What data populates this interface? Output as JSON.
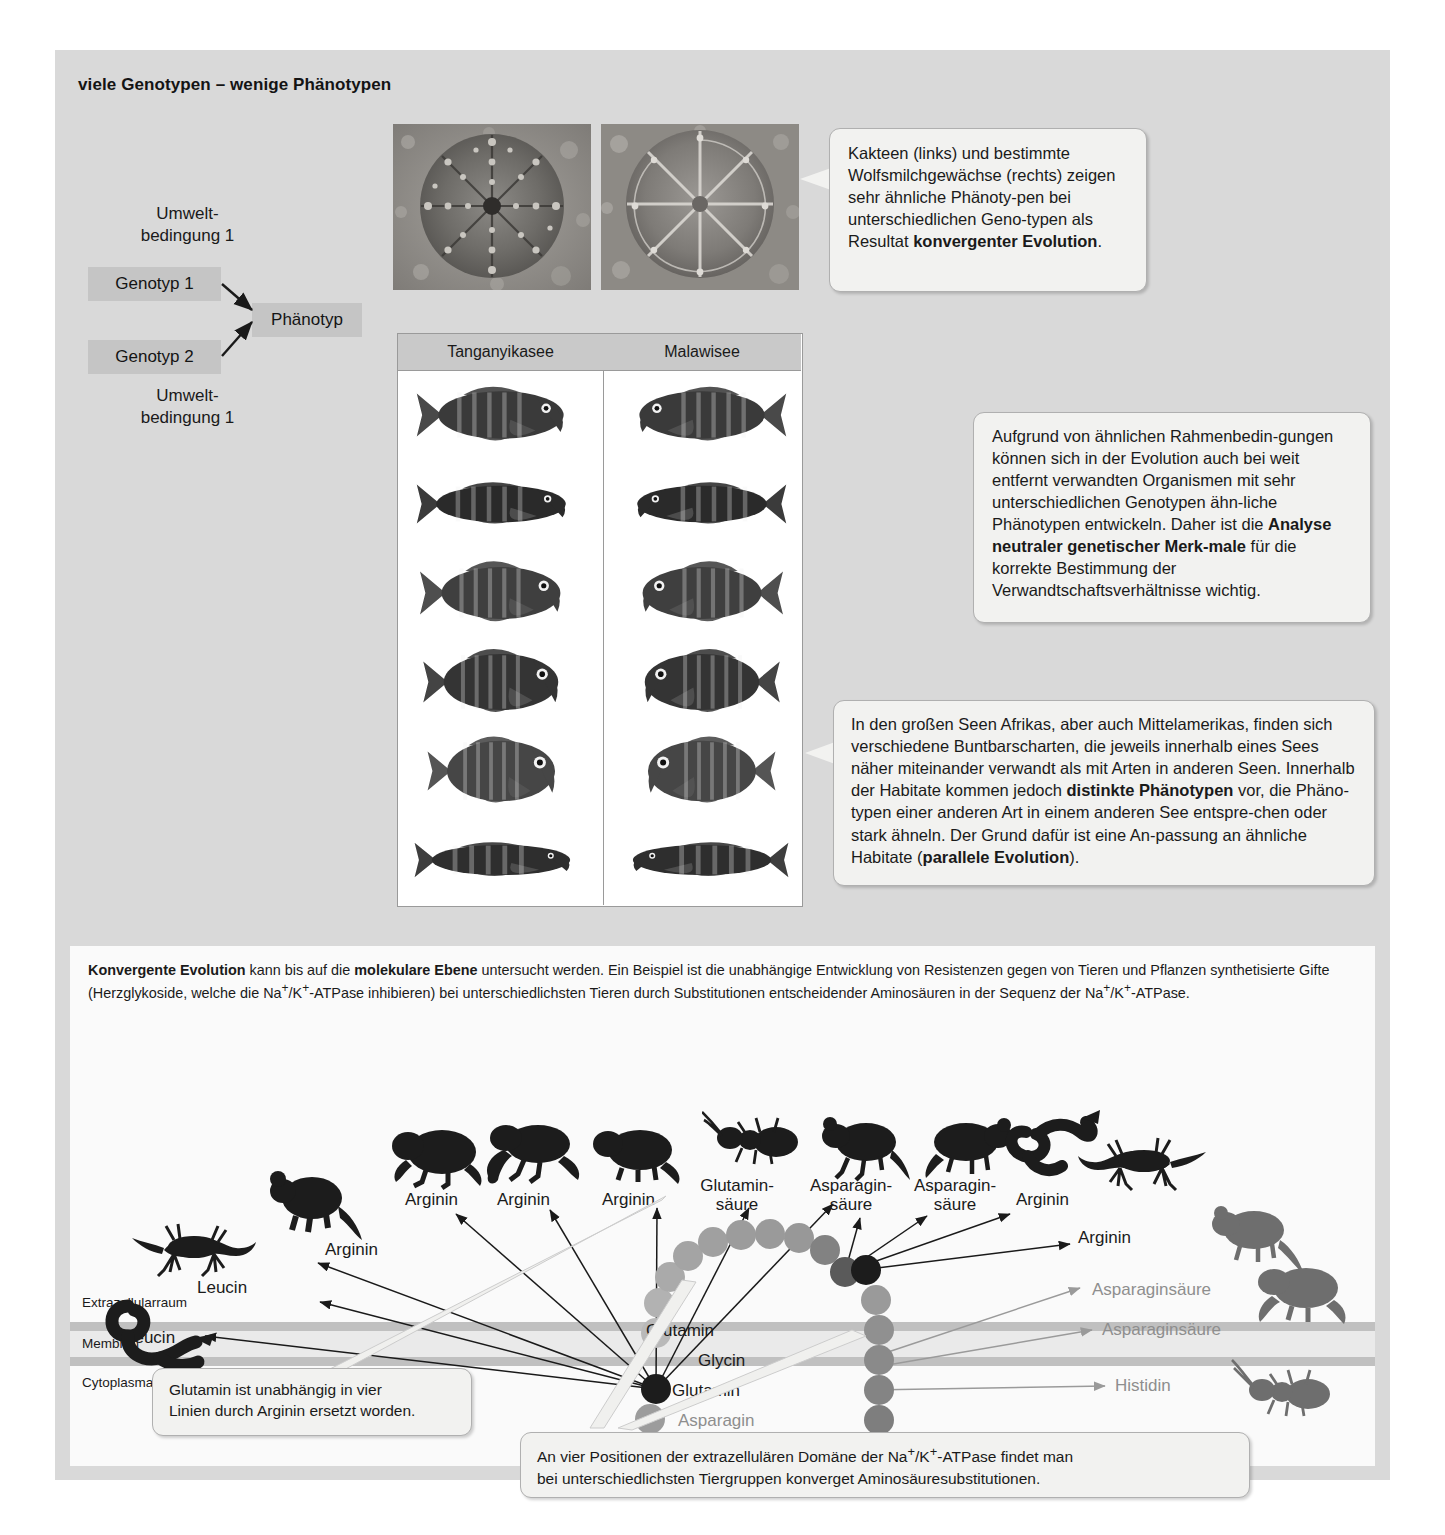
{
  "figure": {
    "title": "viele Genotypen – wenige Phänotypen"
  },
  "genotype_schema": {
    "env_top": "Umwelt-\nbedingung  1",
    "env_bottom": "Umwelt-\nbedingung  1",
    "genotype_1": "Genotyp 1",
    "genotype_2": "Genotyp 2",
    "phenotype": "Phänotyp"
  },
  "callouts": {
    "cacti": {
      "text_parts": [
        {
          "t": "Kakteen (links) und bestimmte Wolfsmilchgewächse (rechts) zeigen sehr ähnliche Phänoty-pen bei unterschiedlichen Geno-typen als Resultat ",
          "b": false
        },
        {
          "t": "konvergenter Evolution",
          "b": true
        },
        {
          "t": ".",
          "b": false
        }
      ]
    },
    "neutral_markers": {
      "text_parts": [
        {
          "t": "Aufgrund von ähnlichen Rahmenbedin-gungen können sich in der Evolution auch bei weit entfernt verwandten Organismen mit sehr unterschiedlichen Genotypen ähn-liche Phänotypen entwickeln. Daher ist die ",
          "b": false
        },
        {
          "t": "Analyse neutraler genetischer Merk-male",
          "b": true
        },
        {
          "t": " für die korrekte Bestimmung der Verwandtschaftsverhältnisse wichtig.",
          "b": false
        }
      ]
    },
    "cichlids": {
      "text_parts": [
        {
          "t": "In den großen Seen Afrikas, aber auch Mittelamerikas, finden sich verschiedene Buntbarscharten, die jeweils innerhalb eines Sees näher miteinander verwandt als mit Arten in anderen Seen. Innerhalb der Habitate kommen jedoch ",
          "b": false
        },
        {
          "t": "distinkte Phänotypen",
          "b": true
        },
        {
          "t": " vor, die Phäno-typen einer anderen Art in einem anderen See entspre-chen oder stark ähneln. Der Grund dafür ist eine An-passung an ähnliche Habitate (",
          "b": false
        },
        {
          "t": "parallele Evolution",
          "b": true
        },
        {
          "t": ").",
          "b": false
        }
      ]
    },
    "glutamin_note": {
      "text": "Glutamin ist unabhängig in vier\nLinien durch Arginin ersetzt worden."
    },
    "positions_note": {
      "text_parts": [
        {
          "t": "An vier Positionen der extrazellulären Domäne der Na",
          "b": false
        },
        {
          "t": "+",
          "b": false,
          "sup": true
        },
        {
          "t": "/K",
          "b": false
        },
        {
          "t": "+",
          "b": false,
          "sup": true
        },
        {
          "t": "-ATPase findet man\nbei unterschiedlichsten Tiergruppen konverget Aminosäuresubstitutionen.",
          "b": false
        }
      ]
    }
  },
  "fish_table": {
    "headers": [
      "Tanganyikasee",
      "Malawisee"
    ],
    "row_count": 6
  },
  "molecular": {
    "intro_parts": [
      {
        "t": "Konvergente Evolution",
        "b": true
      },
      {
        "t": " kann bis auf die ",
        "b": false
      },
      {
        "t": "molekulare Ebene",
        "b": true
      },
      {
        "t": " untersucht werden. Ein Beispiel ist die unabhängige Entwicklung von Resistenzen gegen von Tieren und Pflanzen synthetisierte Gifte (Herzglykoside, welche die Na",
        "b": false
      },
      {
        "t": "+",
        "b": false,
        "sup": true
      },
      {
        "t": "/K",
        "b": false
      },
      {
        "t": "+",
        "b": false,
        "sup": true
      },
      {
        "t": "-ATPase inhibieren) bei unterschiedlichsten Tieren durch Substitutionen entscheidender Aminosäuren in der Sequenz der Na",
        "b": false
      },
      {
        "t": "+",
        "b": false,
        "sup": true
      },
      {
        "t": "/K",
        "b": false
      },
      {
        "t": "+",
        "b": false,
        "sup": true
      },
      {
        "t": "-ATPase.",
        "b": false
      }
    ],
    "layers": {
      "extracellular": "Extrazellularraum",
      "membrane": "Membran",
      "cytoplasm": "Cytoplasma"
    },
    "chain_labels": {
      "glutamin_left": "Glutamin",
      "glutamin_top": "Glutamin",
      "glycin": "Glycin",
      "asparagin": "Asparagin"
    },
    "substitutions": [
      {
        "id": "leucin-snake",
        "label": "Leucin",
        "grey": false
      },
      {
        "id": "leucin-lizard",
        "label": "Leucin",
        "grey": false
      },
      {
        "id": "arginin-rat",
        "label": "Arginin",
        "grey": false
      },
      {
        "id": "arginin-toad1",
        "label": "Arginin",
        "grey": false
      },
      {
        "id": "arginin-frog",
        "label": "Arginin",
        "grey": false
      },
      {
        "id": "arginin-toad2",
        "label": "Arginin",
        "grey": false
      },
      {
        "id": "glutaminsaeure-ant",
        "label": "Glutamin-\nsäure",
        "grey": false
      },
      {
        "id": "asparaginsaeure-rat",
        "label": "Asparagin-\nsäure",
        "grey": false
      },
      {
        "id": "asparaginsaeure-mouse",
        "label": "Asparagin-\nsäure",
        "grey": false
      },
      {
        "id": "arginin-snake2",
        "label": "Arginin",
        "grey": false
      },
      {
        "id": "arginin-lizard2",
        "label": "Arginin",
        "grey": false
      },
      {
        "id": "asparaginsaeure-mouse-grey",
        "label": "Asparaginsäure",
        "grey": true
      },
      {
        "id": "asparaginsaeure-frog-grey",
        "label": "Asparaginsäure",
        "grey": true
      },
      {
        "id": "histidin-ant-grey",
        "label": "Histidin",
        "grey": true
      }
    ]
  },
  "colors": {
    "panel_bg": "#d9d9d9",
    "inner_bg": "#fafafa",
    "callout_bg": "#f2f2f0",
    "chain_light": "#b9b9b9",
    "chain_mid": "#8f8f8f",
    "chain_dark": "#4d4d4d",
    "chain_black": "#1c1c1c",
    "grey_text": "#8e8e8e"
  }
}
